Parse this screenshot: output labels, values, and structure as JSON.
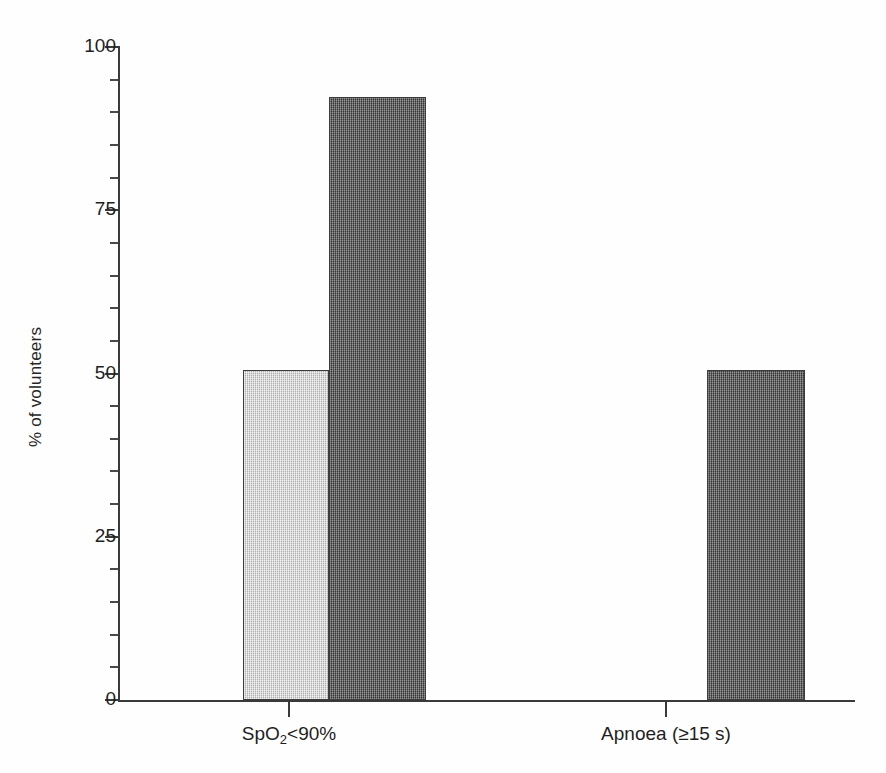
{
  "chart_data": {
    "type": "bar",
    "title": "",
    "subtitle": "",
    "xlabel": "",
    "ylabel": "% of volunteers",
    "ylim": [
      0,
      100
    ],
    "xlim_note": "two category groups, grouped bars",
    "grid": false,
    "legend": "none",
    "categories": [
      "SpO₂<90%",
      "Apnoea (≥15 s)"
    ],
    "category_labels_html": [
      "SpO<sub>2</sub>&lt;90%",
      "Apnoea (≥15 s)"
    ],
    "series": [
      {
        "name": "light-series",
        "color": "#c9c9c9",
        "values": [
          50.5,
          0
        ]
      },
      {
        "name": "dark-series",
        "color": "#5d5d5d",
        "values": [
          92.3,
          50.5
        ]
      }
    ],
    "y_ticks_major": [
      0,
      25,
      50,
      75,
      100
    ],
    "y_tick_labels": [
      "0",
      "25",
      "50",
      "75",
      "100"
    ],
    "y_ticks_minor": [
      5,
      10,
      15,
      20,
      30,
      35,
      40,
      45,
      55,
      60,
      65,
      70,
      80,
      85,
      90,
      95
    ],
    "axis_color": "#3a3a3a",
    "background_color": "#ffffff"
  }
}
